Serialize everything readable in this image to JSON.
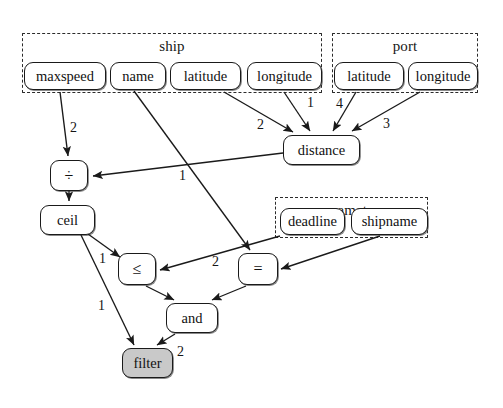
{
  "diagram": {
    "background": "#ffffff",
    "stroke_color": "#1a1a1a",
    "shaded_fill": "#c9c9c9"
  },
  "groups": [
    {
      "id": "ship",
      "label": "ship",
      "x": 22,
      "y": 33,
      "w": 300,
      "h": 60
    },
    {
      "id": "port",
      "label": "port",
      "x": 332,
      "y": 33,
      "w": 146,
      "h": 60
    },
    {
      "id": "parameters",
      "label": "parameters",
      "x": 275,
      "y": 197,
      "w": 153,
      "h": 41
    }
  ],
  "nodes": [
    {
      "id": "ship_maxspeed",
      "label": "maxspeed",
      "x": 24,
      "y": 62,
      "w": 82,
      "h": 28,
      "shaded": false,
      "group": "ship"
    },
    {
      "id": "ship_name",
      "label": "name",
      "x": 110,
      "y": 62,
      "w": 56,
      "h": 28,
      "shaded": false,
      "group": "ship"
    },
    {
      "id": "ship_latitude",
      "label": "latitude",
      "x": 170,
      "y": 62,
      "w": 71,
      "h": 28,
      "shaded": false,
      "group": "ship"
    },
    {
      "id": "ship_longitude",
      "label": "longitude",
      "x": 247,
      "y": 62,
      "w": 75,
      "h": 28,
      "shaded": false,
      "group": "ship"
    },
    {
      "id": "port_latitude",
      "label": "latitude",
      "x": 334,
      "y": 62,
      "w": 70,
      "h": 28,
      "shaded": false,
      "group": "port"
    },
    {
      "id": "port_longitude",
      "label": "longitude",
      "x": 408,
      "y": 62,
      "w": 70,
      "h": 28,
      "shaded": false,
      "group": "port"
    },
    {
      "id": "distance",
      "label": "distance",
      "x": 283,
      "y": 135,
      "w": 77,
      "h": 30,
      "shaded": false,
      "group": null
    },
    {
      "id": "divide",
      "label": "÷",
      "x": 50,
      "y": 160,
      "w": 38,
      "h": 31,
      "shaded": false,
      "group": null,
      "op": true
    },
    {
      "id": "ceil",
      "label": "ceil",
      "x": 40,
      "y": 205,
      "w": 55,
      "h": 30,
      "shaded": false,
      "group": null
    },
    {
      "id": "deadline",
      "label": "deadline",
      "x": 280,
      "y": 208,
      "w": 65,
      "h": 27,
      "shaded": false,
      "group": "parameters"
    },
    {
      "id": "shipname",
      "label": "shipname",
      "x": 351,
      "y": 208,
      "w": 77,
      "h": 27,
      "shaded": false,
      "group": "parameters"
    },
    {
      "id": "leq",
      "label": "≤",
      "x": 118,
      "y": 253,
      "w": 38,
      "h": 32,
      "shaded": false,
      "group": null,
      "op": true
    },
    {
      "id": "equals",
      "label": "=",
      "x": 238,
      "y": 253,
      "w": 40,
      "h": 32,
      "shaded": false,
      "group": null,
      "op": true
    },
    {
      "id": "and",
      "label": "and",
      "x": 166,
      "y": 303,
      "w": 52,
      "h": 30,
      "shaded": false,
      "group": null
    },
    {
      "id": "filter",
      "label": "filter",
      "x": 122,
      "y": 348,
      "w": 51,
      "h": 30,
      "shaded": true,
      "group": null
    }
  ],
  "edges": [
    {
      "id": "e-maxspeed-divide",
      "from": "ship_maxspeed",
      "to": "divide",
      "label": "2",
      "label_x": 70,
      "label_y": 120
    },
    {
      "id": "e-shiplat-distance",
      "from": "ship_latitude",
      "to": "distance",
      "label": "2",
      "label_x": 257,
      "label_y": 117
    },
    {
      "id": "e-shiplon-distance",
      "from": "ship_longitude",
      "to": "distance",
      "label": "1",
      "label_x": 307,
      "label_y": 95
    },
    {
      "id": "e-portlat-distance",
      "from": "port_latitude",
      "to": "distance",
      "label": "4",
      "label_x": 336,
      "label_y": 96
    },
    {
      "id": "e-portlon-distance",
      "from": "port_longitude",
      "to": "distance",
      "label": "3",
      "label_x": 383,
      "label_y": 116
    },
    {
      "id": "e-distance-divide",
      "from": "distance",
      "to": "divide",
      "label": "1",
      "label_x": 179,
      "label_y": 168
    },
    {
      "id": "e-divide-ceil",
      "from": "divide",
      "to": "ceil",
      "label": "",
      "label_x": 0,
      "label_y": 0
    },
    {
      "id": "e-ceil-leq",
      "from": "ceil",
      "to": "leq",
      "label": "1",
      "label_x": 99,
      "label_y": 251
    },
    {
      "id": "e-ceil-filter",
      "from": "ceil",
      "to": "filter",
      "label": "1",
      "label_x": 98,
      "label_y": 298
    },
    {
      "id": "e-deadline-leq",
      "from": "deadline",
      "to": "leq",
      "label": "2",
      "label_x": 212,
      "label_y": 254
    },
    {
      "id": "e-shipname-equals",
      "from": "shipname",
      "to": "equals",
      "label": "",
      "label_x": 0,
      "label_y": 0
    },
    {
      "id": "e-name-equals",
      "from": "ship_name",
      "to": "equals",
      "label": "",
      "label_x": 0,
      "label_y": 0
    },
    {
      "id": "e-leq-and",
      "from": "leq",
      "to": "and",
      "label": "",
      "label_x": 0,
      "label_y": 0
    },
    {
      "id": "e-equals-and",
      "from": "equals",
      "to": "and",
      "label": "",
      "label_x": 0,
      "label_y": 0
    },
    {
      "id": "e-and-filter",
      "from": "and",
      "to": "filter",
      "label": "2",
      "label_x": 177,
      "label_y": 344
    }
  ],
  "edge_paths": [
    {
      "id": "p-maxspeed-divide",
      "d": "M 60,92 L 68,156",
      "label_ref": "e-maxspeed-divide"
    },
    {
      "id": "p-shiplat-distance",
      "d": "M 224,92 L 293,132",
      "label_ref": "e-shiplat-distance"
    },
    {
      "id": "p-shiplon-distance",
      "d": "M 284,92 L 310,131",
      "label_ref": "e-shiplon-distance"
    },
    {
      "id": "p-portlat-distance",
      "d": "M 356,92 L 333,131",
      "label_ref": "e-portlat-distance"
    },
    {
      "id": "p-portlon-distance",
      "d": "M 420,92 L 352,131",
      "label_ref": "e-portlon-distance"
    },
    {
      "id": "p-distance-divide",
      "d": "M 283,153 L 93,176",
      "label_ref": "e-distance-divide"
    },
    {
      "id": "p-divide-ceil",
      "d": "M 69,191 L 69,201",
      "label_ref": "e-divide-ceil"
    },
    {
      "id": "p-ceil-leq",
      "d": "M 88,234 L 120,257",
      "label_ref": "e-ceil-leq"
    },
    {
      "id": "p-ceil-filter",
      "d": "M 81,235 L 134,345",
      "label_ref": "e-ceil-filter"
    },
    {
      "id": "p-deadline-leq",
      "d": "M 280,236 L 160,270",
      "label_ref": "e-deadline-leq"
    },
    {
      "id": "p-shipname-equals",
      "d": "M 380,236 L 281,269",
      "label_ref": "e-shipname-equals"
    },
    {
      "id": "p-name-equals",
      "d": "M 134,91 L 250,250",
      "label_ref": "e-name-equals"
    },
    {
      "id": "p-leq-and",
      "d": "M 146,286 L 174,300",
      "label_ref": "e-leq-and"
    },
    {
      "id": "p-equals-and",
      "d": "M 246,286 L 212,300",
      "label_ref": "e-equals-and"
    },
    {
      "id": "p-and-filter",
      "d": "M 175,334 L 157,345",
      "label_ref": "e-and-filter"
    }
  ]
}
